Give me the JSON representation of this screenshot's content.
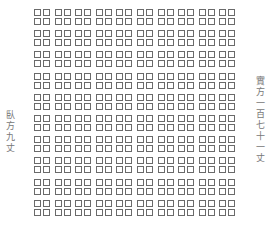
{
  "diagram": {
    "title": "",
    "left_label": "臥方九丈",
    "right_label": "實方一百七十一丈",
    "grid": {
      "rows": 10,
      "columns": 10,
      "cell_glyph": "four-small-squares"
    },
    "colors": {
      "line": "#6a6a6a",
      "text": "#777777",
      "background": "#ffffff"
    }
  }
}
